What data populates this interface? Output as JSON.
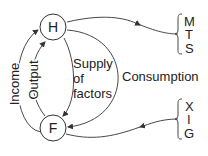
{
  "nodes": {
    "household": {
      "label": "H"
    },
    "firm": {
      "label": "F"
    }
  },
  "flows": {
    "income": "Income",
    "output": "Output",
    "supply_line1": "Supply",
    "supply_line2": "of",
    "supply_line3": "factors",
    "consumption": "Consumption"
  },
  "leakages": [
    "M",
    "T",
    "S"
  ],
  "injections": [
    "X",
    "I",
    "G"
  ],
  "colors": {
    "line": "#333333",
    "text": "#222222"
  }
}
